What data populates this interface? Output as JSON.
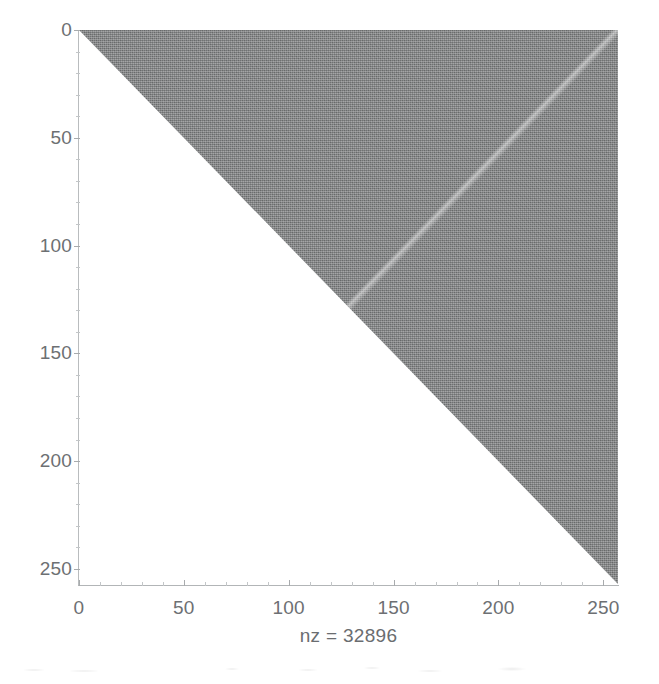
{
  "figure": {
    "background_color": "#ffffff",
    "plot_background_color": "#ffffff",
    "axis_line_color": "#b2b5b7",
    "text_color": "#6d7073"
  },
  "chart_data": {
    "type": "heatmap",
    "subtype": "spy-sparsity-pattern",
    "title": "",
    "subtitle": "",
    "xlabel": "nz = 32896",
    "ylabel": "",
    "nz": 32896,
    "matrix_size": [
      257,
      257
    ],
    "pattern": "upper-triangular",
    "fill_color": "#7e8082",
    "marker_color": "#7e8082",
    "grid": false,
    "legend": "none",
    "xlim": [
      0,
      257
    ],
    "ylim": [
      257,
      0
    ],
    "y_axis_inverted": true,
    "xticks": [
      0,
      50,
      100,
      150,
      200,
      250
    ],
    "xticklabels": [
      "0",
      "50",
      "100",
      "150",
      "200",
      "250"
    ],
    "yticks": [
      0,
      50,
      100,
      150,
      200,
      250
    ],
    "yticklabels": [
      "0",
      "50",
      "100",
      "150",
      "200",
      "250"
    ],
    "x_minor_tick_step": 10,
    "y_minor_tick_step": 10,
    "vertices": [
      {
        "x": 0,
        "y": 0
      },
      {
        "x": 257,
        "y": 0
      },
      {
        "x": 257,
        "y": 257
      }
    ]
  },
  "axes": {
    "x": {
      "ticks": [
        {
          "value": 0,
          "label": "0"
        },
        {
          "value": 50,
          "label": "50"
        },
        {
          "value": 100,
          "label": "100"
        },
        {
          "value": 150,
          "label": "150"
        },
        {
          "value": 200,
          "label": "200"
        },
        {
          "value": 250,
          "label": "250"
        }
      ],
      "caption": "nz = 32896"
    },
    "y": {
      "ticks": [
        {
          "value": 0,
          "label": "0"
        },
        {
          "value": 50,
          "label": "50"
        },
        {
          "value": 100,
          "label": "100"
        },
        {
          "value": 150,
          "label": "150"
        },
        {
          "value": 200,
          "label": "200"
        },
        {
          "value": 250,
          "label": "250"
        }
      ]
    }
  }
}
